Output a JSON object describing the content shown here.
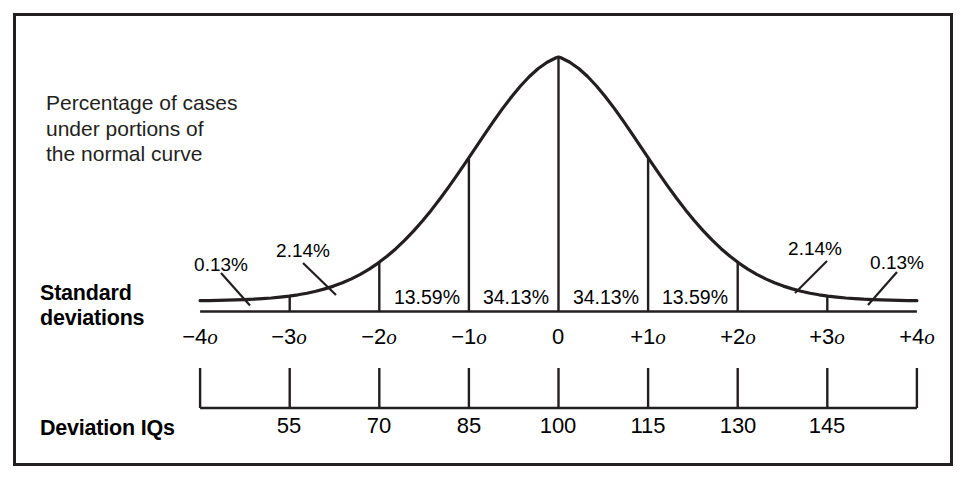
{
  "figure": {
    "caption": "Percentage of cases\nunder portions of\nthe normal curve",
    "axis_titles": {
      "standard_deviations": "Standard\ndeviations",
      "deviation_iqs": "Deviation IQs"
    },
    "colors": {
      "ink": "#231f20",
      "curve": "#231f20",
      "background": "#ffffff",
      "frame": "#231f20"
    }
  },
  "chart_data": {
    "type": "line",
    "xlabel": "Standard deviations",
    "ylabel": "",
    "xlim": [
      -4,
      4
    ],
    "ylim": [
      0,
      1
    ],
    "grid": false,
    "legend_position": "none",
    "x": [
      -4,
      -3,
      -2,
      -1,
      0,
      1,
      2,
      3,
      4
    ],
    "sigma_tick_labels": [
      "−4o",
      "−3o",
      "−2o",
      "−1o",
      "0",
      "+1o",
      "+2o",
      "+3o",
      "+4o"
    ],
    "iq_tick_values": [
      55,
      70,
      85,
      100,
      115,
      130,
      145
    ],
    "iq_tick_labels": [
      "55",
      "70",
      "85",
      "100",
      "115",
      "130",
      "145"
    ],
    "iq_tick_sigma": [
      -3,
      -2,
      -1,
      0,
      1,
      2,
      3
    ],
    "band_percentages": [
      {
        "range": "-4o to -3o",
        "label": "0.13%",
        "value": 0.13,
        "callout": true
      },
      {
        "range": "-3o to -2o",
        "label": "2.14%",
        "value": 2.14,
        "callout": true
      },
      {
        "range": "-2o to -1o",
        "label": "13.59%",
        "value": 13.59,
        "callout": false
      },
      {
        "range": "-1o to 0",
        "label": "34.13%",
        "value": 34.13,
        "callout": false
      },
      {
        "range": "0 to +1o",
        "label": "34.13%",
        "value": 34.13,
        "callout": false
      },
      {
        "range": "+1o to +2o",
        "label": "13.59%",
        "value": 13.59,
        "callout": false
      },
      {
        "range": "+2o to +3o",
        "label": "2.14%",
        "value": 2.14,
        "callout": true
      },
      {
        "range": "+3o to +4o",
        "label": "0.13%",
        "value": 0.13,
        "callout": true
      }
    ],
    "inline_labels": {
      "left_1359": "13.59%",
      "left_3413": "34.13%",
      "right_3413": "34.13%",
      "right_1359": "13.59%"
    },
    "callout_labels": {
      "left_013": "0.13%",
      "left_214": "2.14%",
      "right_214": "2.14%",
      "right_013": "0.13%"
    }
  }
}
